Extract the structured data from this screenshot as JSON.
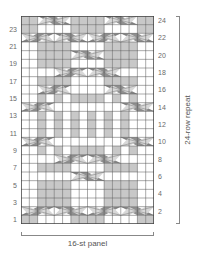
{
  "chart": {
    "columns": 16,
    "rows": 24,
    "colors": {
      "knit": "#ffffff",
      "shaded": "#c8c8c8",
      "cable_dark": "#8f8f8f",
      "cable_light": "#d8d8d8",
      "grid": "#555555"
    },
    "shaded_cells": {
      "1": [
        1,
        2,
        7,
        8,
        9,
        10,
        15,
        16
      ],
      "3": [
        3,
        4,
        5,
        6,
        11,
        12,
        13,
        14
      ],
      "4": [
        3,
        4,
        5,
        6,
        11,
        12,
        13,
        14
      ],
      "5": [
        3,
        4,
        5,
        6,
        11,
        12,
        13,
        14
      ],
      "7": [
        3,
        4,
        5,
        6,
        11,
        12,
        13,
        14
      ],
      "9": [
        3,
        5,
        7,
        8,
        9,
        10,
        12,
        14
      ],
      "11": [
        3,
        5,
        7,
        9,
        11,
        13
      ],
      "12": [
        3,
        5,
        7,
        9,
        11,
        13
      ],
      "13": [
        3,
        5,
        7,
        9,
        11,
        13
      ],
      "15": [
        3,
        5,
        7,
        8,
        9,
        10,
        12,
        14
      ],
      "17": [
        3,
        4,
        5,
        6,
        11,
        12,
        13,
        14
      ],
      "19": [
        3,
        4,
        5,
        6,
        11,
        12,
        13,
        14
      ],
      "20": [
        3,
        4,
        5,
        6,
        11,
        12,
        13,
        14
      ],
      "21": [
        3,
        4,
        5,
        6,
        11,
        12,
        13,
        14
      ],
      "23": [
        1,
        2,
        7,
        8,
        9,
        10,
        15,
        16
      ],
      "24": [
        1,
        2,
        7,
        8,
        9,
        10,
        15,
        16
      ]
    },
    "cables": [
      {
        "row": 2,
        "start": 1,
        "width": 4,
        "dir": "right"
      },
      {
        "row": 2,
        "start": 5,
        "width": 4,
        "dir": "left"
      },
      {
        "row": 2,
        "start": 9,
        "width": 4,
        "dir": "right"
      },
      {
        "row": 2,
        "start": 13,
        "width": 4,
        "dir": "left"
      },
      {
        "row": 6,
        "start": 7,
        "width": 4,
        "dir": "left"
      },
      {
        "row": 8,
        "start": 5,
        "width": 4,
        "dir": "right"
      },
      {
        "row": 8,
        "start": 9,
        "width": 4,
        "dir": "left"
      },
      {
        "row": 10,
        "start": 1,
        "width": 4,
        "dir": "right"
      },
      {
        "row": 10,
        "start": 13,
        "width": 4,
        "dir": "left"
      },
      {
        "row": 14,
        "start": 1,
        "width": 4,
        "dir": "right"
      },
      {
        "row": 14,
        "start": 13,
        "width": 4,
        "dir": "left"
      },
      {
        "row": 16,
        "start": 3,
        "width": 4,
        "dir": "right"
      },
      {
        "row": 16,
        "start": 11,
        "width": 4,
        "dir": "left"
      },
      {
        "row": 18,
        "start": 5,
        "width": 4,
        "dir": "right"
      },
      {
        "row": 18,
        "start": 9,
        "width": 4,
        "dir": "left"
      },
      {
        "row": 20,
        "start": 7,
        "width": 4,
        "dir": "left"
      },
      {
        "row": 22,
        "start": 1,
        "width": 4,
        "dir": "right"
      },
      {
        "row": 22,
        "start": 5,
        "width": 4,
        "dir": "left"
      },
      {
        "row": 22,
        "start": 9,
        "width": 4,
        "dir": "right"
      },
      {
        "row": 22,
        "start": 13,
        "width": 4,
        "dir": "left"
      },
      {
        "row": 24,
        "start": 3,
        "width": 4,
        "dir": "left"
      },
      {
        "row": 24,
        "start": 11,
        "width": 4,
        "dir": "left"
      }
    ],
    "left_row_labels": [
      "1",
      "3",
      "5",
      "7",
      "9",
      "11",
      "13",
      "15",
      "17",
      "19",
      "21",
      "23"
    ],
    "right_row_labels": [
      "2",
      "4",
      "6",
      "8",
      "10",
      "12",
      "14",
      "16",
      "18",
      "20",
      "22",
      "24"
    ]
  },
  "labels": {
    "repeat": "24-row repeat",
    "panel": "16-st panel"
  }
}
